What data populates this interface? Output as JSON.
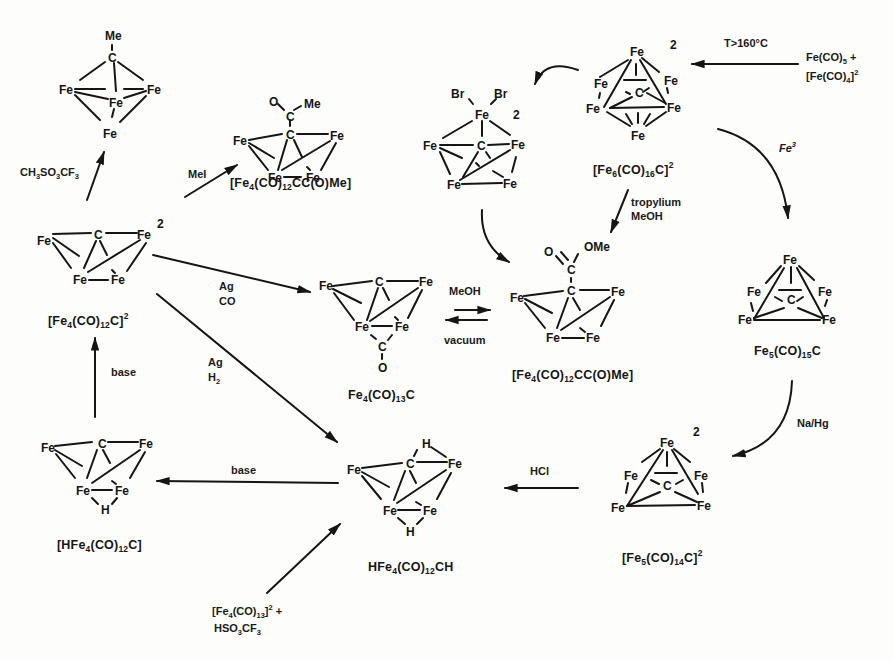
{
  "figure": {
    "type": "reaction-scheme"
  },
  "compounds": {
    "methylidyne": {
      "label": "",
      "atoms": [
        "Me",
        "C",
        "Fe",
        "Fe",
        "Fe",
        "Fe"
      ]
    },
    "acyl_me": {
      "label_parts": [
        "[Fe",
        "4",
        "(CO)",
        "12",
        "CC(O)Me]"
      ],
      "atoms": [
        "O",
        "C",
        "Me",
        "C",
        "Fe",
        "Fe",
        "Fe",
        "Fe"
      ]
    },
    "fe6_br2": {
      "charge": "2",
      "atoms": [
        "Br",
        "Br",
        "Fe",
        "Fe",
        "C",
        "Fe",
        "Fe",
        "Fe"
      ]
    },
    "fe6": {
      "label_parts": [
        "[Fe",
        "6",
        "(CO)",
        "16",
        "C]",
        "2"
      ],
      "charge": "2"
    },
    "fe4_dianion": {
      "label_parts": [
        "[Fe",
        "4",
        "(CO)",
        "12",
        "C]",
        "2"
      ],
      "charge": "2"
    },
    "fe4co13c": {
      "label_parts": [
        "Fe",
        "4",
        "(CO)",
        "13",
        "C"
      ]
    },
    "ester": {
      "label_parts": [
        "[Fe",
        "4",
        "(CO)",
        "12",
        "CC(O)Me]"
      ],
      "substituent": "OMe"
    },
    "fe5co15c": {
      "label_parts": [
        "Fe",
        "5",
        "(CO)",
        "15",
        "C"
      ]
    },
    "hfe4": {
      "label_parts": [
        "[HFe",
        "4",
        "(CO)",
        "12",
        "C]"
      ]
    },
    "hfe4ch": {
      "label_parts": [
        "HFe",
        "4",
        "(CO)",
        "12",
        "CH"
      ]
    },
    "fe5co14c": {
      "label_parts": [
        "[Fe",
        "5",
        "(CO)",
        "14",
        "C]",
        "2"
      ],
      "charge": "2·"
    }
  },
  "reagents": {
    "triflate": [
      "CH",
      "3",
      "SO",
      "3",
      "CF",
      "3"
    ],
    "mei": "MeI",
    "heat": "T>160°C",
    "feco5": [
      "Fe(CO)",
      "5",
      " +"
    ],
    "feco4": [
      "[Fe(CO)",
      "4",
      "]",
      "2"
    ],
    "fe3": [
      "Fe",
      "3"
    ],
    "tropylium": "tropylium",
    "meoh_trop": "MeOH",
    "ag_co_1": "Ag",
    "ag_co_2": "CO",
    "ag_h2_1": "Ag",
    "ag_h2_2": [
      "H",
      "2"
    ],
    "meoh": "MeOH",
    "vacuum": "vacuum",
    "base_up": "base",
    "base_left": "base",
    "hcl": "HCl",
    "nahg": "Na/Hg",
    "fe4co13_parts": [
      "[Fe",
      "4",
      "(CO)",
      "13",
      "]",
      "2",
      " +"
    ],
    "hso3cf3": [
      "HSO",
      "3",
      "CF",
      "3"
    ]
  },
  "atom": {
    "Fe": "Fe",
    "C": "C",
    "Me": "Me",
    "O": "O",
    "H": "H",
    "Br": "Br",
    "OMe": "OMe",
    "two": "2"
  }
}
